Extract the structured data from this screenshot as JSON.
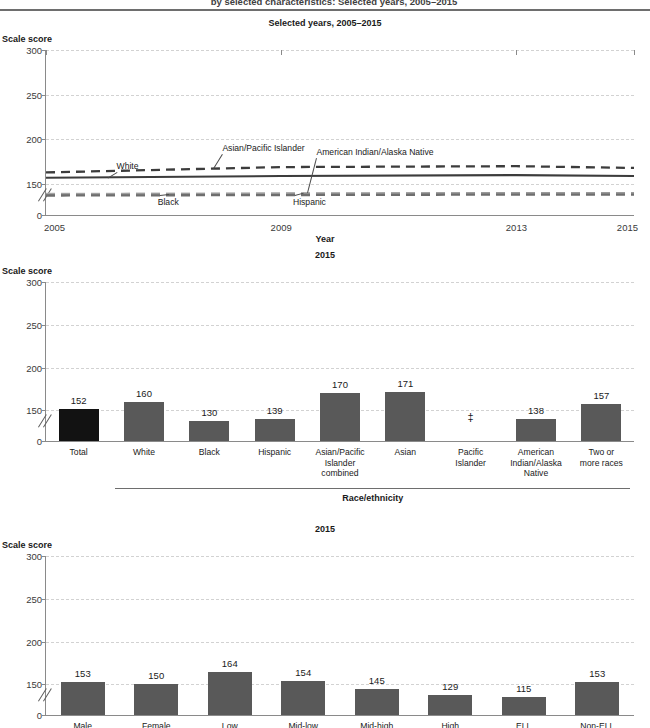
{
  "document": {
    "title_clipped": "by selected characteristics: Selected years, 2005–2015"
  },
  "panels": [
    {
      "id": "line-chart",
      "subtitle": "Selected years, 2005–2015",
      "y_axis_title": "Scale score",
      "x_axis_title": "Year"
    },
    {
      "id": "race-bar-chart",
      "subtitle": "2015",
      "y_axis_title": "Scale score",
      "group_label": "Race/ethnicity"
    },
    {
      "id": "characteristic-bar-chart",
      "subtitle": "2015",
      "y_axis_title": "Scale score"
    }
  ],
  "chart_data": [
    {
      "type": "line",
      "title": "Selected years, 2005–2015",
      "xlabel": "Year",
      "ylabel": "Scale score",
      "ylim": [
        0,
        300
      ],
      "yticks": [
        0,
        150,
        200,
        250,
        300
      ],
      "y_axis_break": true,
      "xlim": [
        2005,
        2015
      ],
      "xticks": [
        2005,
        2009,
        2013,
        2015
      ],
      "xtick_labels": [
        "2005",
        "2009",
        "2013",
        "2015"
      ],
      "grid": true,
      "legend": "inline-annotations",
      "x": [
        2005,
        2009,
        2013,
        2015
      ],
      "series": [
        {
          "name": "Asian/Pacific Islander",
          "values": [
            163,
            169,
            170,
            168
          ],
          "style": "dashed",
          "color": "#3c3c3c",
          "label_x": 2008.0,
          "label_y": 196
        },
        {
          "name": "White",
          "values": [
            157,
            159,
            160,
            159
          ],
          "style": "solid",
          "color": "#3c3c3c",
          "label_x": 2006.2,
          "label_y": 176
        },
        {
          "name": "American Indian/Alaska Native",
          "values": [
            134,
            137,
            139,
            138
          ],
          "style": "dashed",
          "color": "#b4b4b4",
          "label_x": 2009.6,
          "label_y": 191
        },
        {
          "name": "Hispanic",
          "values": [
            130,
            135,
            139,
            139
          ],
          "style": "dashed",
          "color": "#9a9a9a",
          "label_x": 2009.2,
          "label_y": 113
        },
        {
          "name": "Black",
          "values": [
            124,
            127,
            130,
            130
          ],
          "style": "dashed",
          "color": "#6e6e6e",
          "label_x": 2006.9,
          "label_y": 113
        }
      ]
    },
    {
      "type": "bar",
      "title": "2015",
      "ylabel": "Scale score",
      "xlabel": "Race/ethnicity",
      "ylim": [
        0,
        300
      ],
      "yticks": [
        0,
        150,
        200,
        250,
        300
      ],
      "y_axis_break": true,
      "grid": true,
      "categories": [
        "Total",
        "White",
        "Black",
        "Hispanic",
        "Asian/Pacific Islander combined",
        "Asian",
        "Pacific Islander",
        "American Indian/Alaska Native",
        "Two or more races"
      ],
      "category_lines": [
        [
          "Total"
        ],
        [
          "White"
        ],
        [
          "Black"
        ],
        [
          "Hispanic"
        ],
        [
          "Asian/Pacific",
          "Islander",
          "combined"
        ],
        [
          "Asian"
        ],
        [
          "Pacific",
          "Islander"
        ],
        [
          "American",
          "Indian/Alaska",
          "Native"
        ],
        [
          "Two or",
          "more races"
        ]
      ],
      "values": [
        152,
        160,
        130,
        139,
        170,
        171,
        null,
        138,
        157
      ],
      "value_labels": [
        "152",
        "160",
        "130",
        "139",
        "170",
        "171",
        "‡",
        "138",
        "157"
      ],
      "suppressed": [
        "Pacific Islander"
      ],
      "suppression_symbol": "‡",
      "highlight_index": 0,
      "group_bracket": {
        "label": "Race/ethnicity",
        "from": "White",
        "to": "Two or more races"
      }
    },
    {
      "type": "bar",
      "title": "2015",
      "ylabel": "Scale score",
      "ylim": [
        0,
        300
      ],
      "yticks": [
        0,
        150,
        200,
        250,
        300
      ],
      "y_axis_break": true,
      "grid": true,
      "categories": [
        "Male",
        "Female",
        "Low",
        "Mid-low",
        "Mid-high",
        "High",
        "ELL",
        "Non-ELL"
      ],
      "values": [
        153,
        150,
        164,
        154,
        145,
        129,
        115,
        153
      ],
      "value_labels": [
        "153",
        "150",
        "164",
        "154",
        "145",
        "129",
        "115",
        "153"
      ]
    }
  ],
  "colors": {
    "bar_default": "#595959",
    "bar_highlight": "#121212",
    "axis": "#8a8a8a",
    "grid": "#d2d2d2",
    "text": "#1a1a1a"
  }
}
